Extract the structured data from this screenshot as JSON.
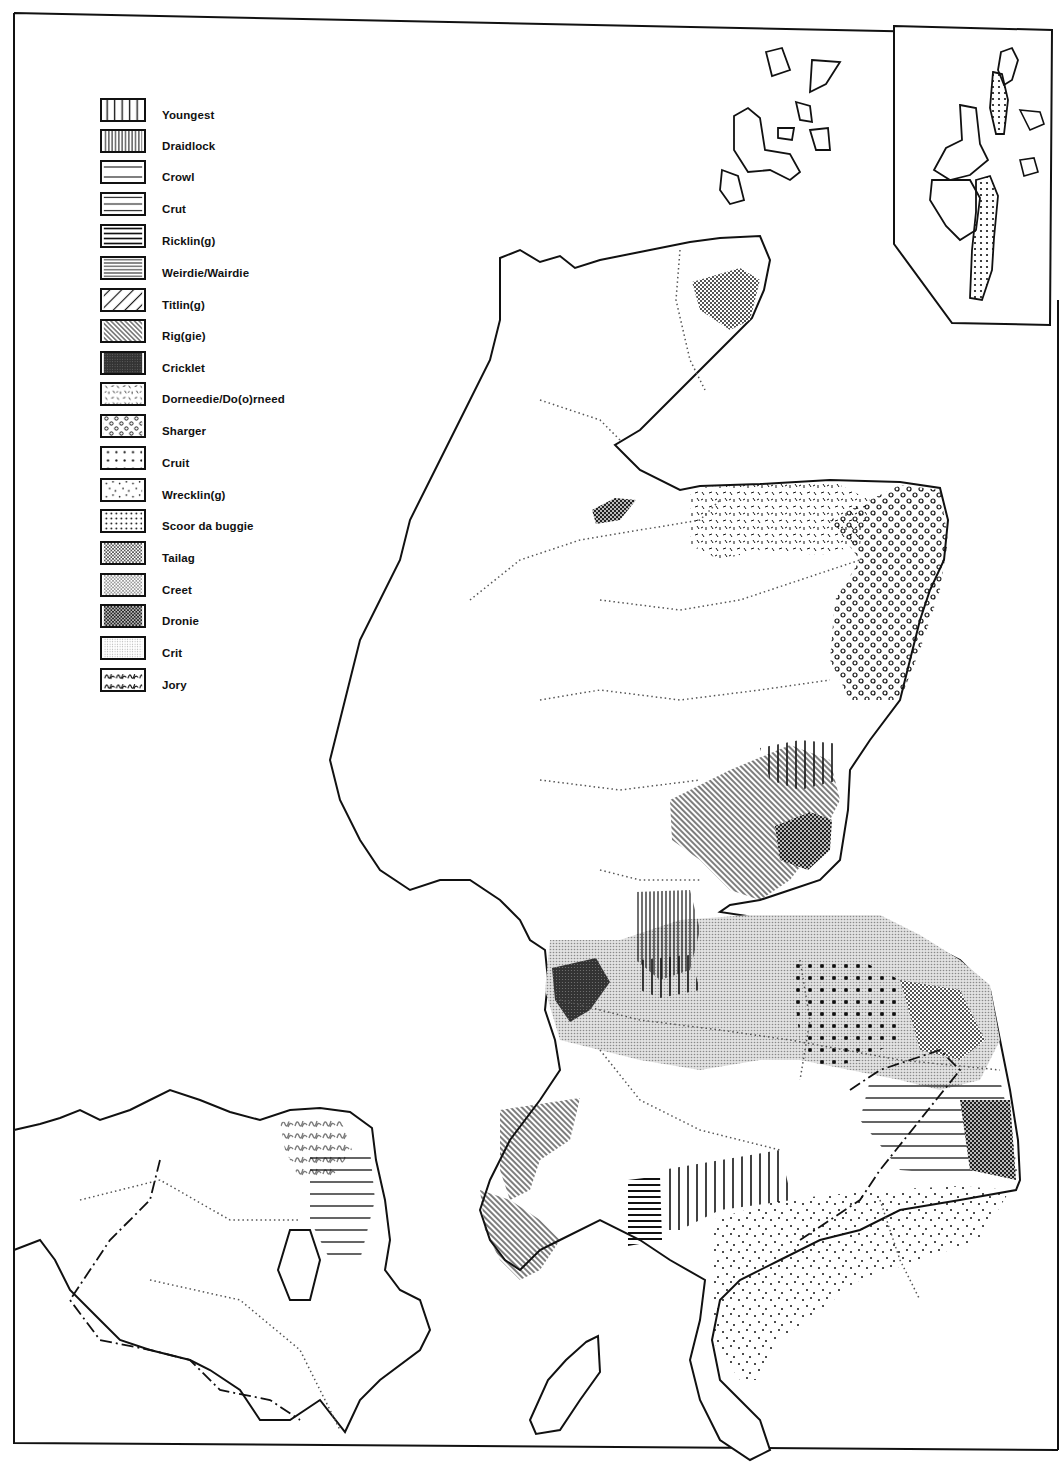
{
  "map": {
    "subject": "Dialect distribution map of Scotland, Northern Ireland and northern England",
    "inset": "Shetland Islands (upper right)",
    "legend": {
      "items": [
        {
          "label": "Youngest",
          "pattern": "vertical-lines-sparse"
        },
        {
          "label": "Draidlock",
          "pattern": "vertical-lines-dense"
        },
        {
          "label": "Crowl",
          "pattern": "horizontal-lines-sparse"
        },
        {
          "label": "Crut",
          "pattern": "horizontal-lines-medium"
        },
        {
          "label": "Ricklin(g)",
          "pattern": "horizontal-lines-bold"
        },
        {
          "label": "Weirdie/Wairdie",
          "pattern": "horizontal-lines-dense"
        },
        {
          "label": "Titlin(g)",
          "pattern": "diagonal-lines-sparse"
        },
        {
          "label": "Rig(gie)",
          "pattern": "diagonal-lines-dense"
        },
        {
          "label": "Cricklet",
          "pattern": "dark-crosshatch"
        },
        {
          "label": "Dorneedie/Do(o)rneed",
          "pattern": "random-dashes"
        },
        {
          "label": "Sharger",
          "pattern": "open-circles"
        },
        {
          "label": "Cruit",
          "pattern": "dots-grid-medium"
        },
        {
          "label": "Wrecklin(g)",
          "pattern": "dots-scattered"
        },
        {
          "label": "Scoor da buggie",
          "pattern": "dots-grid-dense"
        },
        {
          "label": "Tailag",
          "pattern": "checker-medium"
        },
        {
          "label": "Creet",
          "pattern": "checker-light"
        },
        {
          "label": "Dronie",
          "pattern": "checker-dark"
        },
        {
          "label": "Crit",
          "pattern": "fine-stipple"
        },
        {
          "label": "Jory",
          "pattern": "wavy-marks"
        }
      ]
    },
    "colors": {
      "ink": "#111111",
      "paper": "#ffffff",
      "boundary_dotted": "#555555",
      "grey_fill": "#bdbdbd"
    }
  }
}
